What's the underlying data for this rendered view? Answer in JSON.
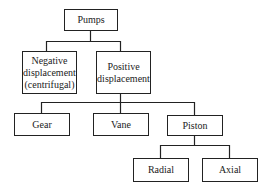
{
  "diagram": {
    "type": "tree",
    "nodes": {
      "root": {
        "label": "Pumps"
      },
      "negative": {
        "label_line1": "Negative",
        "label_line2": "displacement",
        "label_line3": "(centrifugal)"
      },
      "positive": {
        "label_line1": "Positive",
        "label_line2": "displacement"
      },
      "gear": {
        "label": "Gear"
      },
      "vane": {
        "label": "Vane"
      },
      "piston": {
        "label": "Piston"
      },
      "radial": {
        "label": "Radial"
      },
      "axial": {
        "label": "Axial"
      }
    },
    "edges": [
      [
        "Pumps",
        "Negative displacement (centrifugal)"
      ],
      [
        "Pumps",
        "Positive displacement"
      ],
      [
        "Positive displacement",
        "Gear"
      ],
      [
        "Positive displacement",
        "Vane"
      ],
      [
        "Positive displacement",
        "Piston"
      ],
      [
        "Piston",
        "Radial"
      ],
      [
        "Piston",
        "Axial"
      ]
    ],
    "line_color": "#222222"
  }
}
